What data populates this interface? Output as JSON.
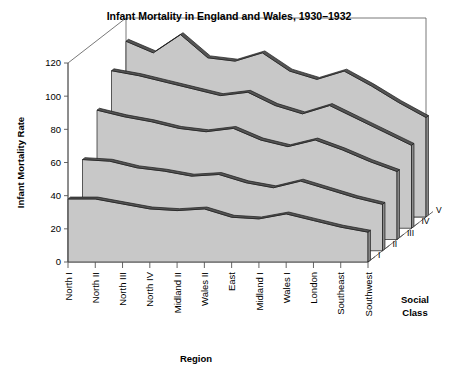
{
  "chart_data": {
    "type": "area",
    "title": "Infant Mortality in England and Wales, 1930–1932",
    "xlabel": "Region",
    "ylabel": "Infant Mortality Rate",
    "zlabel": "Social Class",
    "projection": "3d-ribbon",
    "grid": false,
    "legend_position": "right-depth-axis",
    "ylim": [
      0,
      120
    ],
    "yticks": [
      0,
      20,
      40,
      60,
      80,
      100,
      120
    ],
    "ytick_labels": [
      "0",
      "20",
      "40",
      "60",
      "80",
      "100",
      "120"
    ],
    "categories": [
      "North I",
      "North II",
      "North III",
      "North IV",
      "Midland II",
      "Wales II",
      "East",
      "Midland I",
      "Wales I",
      "London",
      "Southeast",
      "Southwest"
    ],
    "zticks": [
      "I",
      "II",
      "III",
      "IV",
      "V"
    ],
    "series": [
      {
        "name": "I",
        "values": [
          38,
          38,
          35,
          32,
          31,
          32,
          27,
          26,
          29,
          25,
          21,
          18
        ]
      },
      {
        "name": "II",
        "values": [
          55,
          54,
          50,
          48,
          45,
          46,
          41,
          38,
          42,
          37,
          32,
          28
        ]
      },
      {
        "name": "III",
        "values": [
          78,
          74,
          71,
          67,
          65,
          67,
          60,
          56,
          60,
          54,
          47,
          41
        ]
      },
      {
        "name": "IV",
        "values": [
          95,
          92,
          88,
          84,
          80,
          82,
          74,
          69,
          74,
          66,
          58,
          50
        ]
      },
      {
        "name": "V",
        "values": [
          106,
          99,
          110,
          96,
          94,
          99,
          88,
          83,
          88,
          79,
          69,
          60
        ]
      }
    ],
    "colors": {
      "surface_fill": "#c8c8c8",
      "surface_top": "#555555",
      "surface_side": "#8c8c8c",
      "outline": "#1a1a1a",
      "axis": "#555555",
      "background": "#ffffff",
      "text": "#000000"
    }
  }
}
